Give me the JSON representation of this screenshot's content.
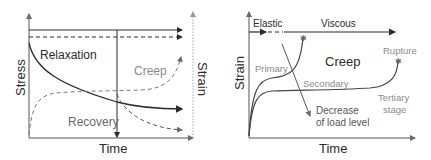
{
  "left_panel": {
    "y_axis_label": "Stress",
    "x_axis_label": "Time",
    "right_axis_label": "Strain",
    "labels": {
      "relaxation": "Relaxation",
      "creep": "Creep",
      "recovery": "Recovery"
    }
  },
  "right_panel": {
    "y_axis_label": "Strain",
    "x_axis_label": "Time",
    "labels": {
      "elastic": "Elastic",
      "viscous": "Viscous",
      "creep": "Creep",
      "primary": "Primary",
      "secondary": "Secondary",
      "tertiary_line1": "Tertiary",
      "tertiary_line2": "stage",
      "rupture": "Rupture",
      "decrease_line1": "Decrease",
      "decrease_line2": "of load level"
    }
  },
  "colors": {
    "dark": "#2b2b2b",
    "gray": "#8a8a8a",
    "light_gray": "#b0b0b0"
  }
}
